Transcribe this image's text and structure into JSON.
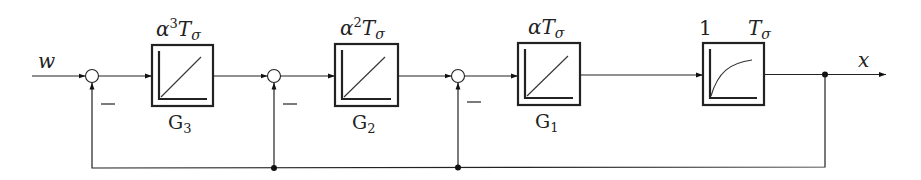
{
  "diagram": {
    "type": "cascaded-control-loop-block-diagram",
    "input_signal": "w",
    "output_signal": "x",
    "sum_points": [
      {
        "id": "s1",
        "sign": "−"
      },
      {
        "id": "s2",
        "sign": "−"
      },
      {
        "id": "s3",
        "sign": "−"
      }
    ],
    "blocks": [
      {
        "id": "G3",
        "label": "G",
        "sub": "3",
        "param_base": "α",
        "param_exp": "3",
        "param_T": "T",
        "param_T_sub": "σ",
        "kind": "integrator-ramp"
      },
      {
        "id": "G2",
        "label": "G",
        "sub": "2",
        "param_base": "α",
        "param_exp": "2",
        "param_T": "T",
        "param_T_sub": "σ",
        "kind": "integrator-ramp"
      },
      {
        "id": "G1",
        "label": "G",
        "sub": "1",
        "param_base": "α",
        "param_exp": "",
        "param_T": "T",
        "param_T_sub": "σ",
        "kind": "integrator-ramp"
      },
      {
        "id": "plant",
        "gain": "1",
        "param_T": "T",
        "param_T_sub": "σ",
        "kind": "pt1-first-order-lag"
      }
    ],
    "feedback": "output x fed back negatively to all three summing points"
  }
}
